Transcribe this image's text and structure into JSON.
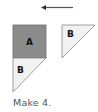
{
  "diagram": {
    "arrow": {
      "direction": "left",
      "color": "#555555"
    },
    "pieces": [
      {
        "id": "square-a",
        "label": "A",
        "shape": "square",
        "fill": "#8c8c8c",
        "stroke": "#6e6e6e"
      },
      {
        "id": "triangle-b-lower",
        "label": "B",
        "shape": "triangle",
        "fill": "#f2f2f2",
        "stroke": "#8a8a8a"
      },
      {
        "id": "triangle-b-right",
        "label": "B",
        "shape": "triangle",
        "fill": "#f2f2f2",
        "stroke": "#8a8a8a"
      }
    ],
    "caption": "Make 4."
  }
}
